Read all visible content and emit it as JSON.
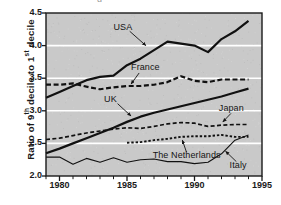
{
  "figure": {
    "partial_top_text": "g",
    "background_color": "#c9c9c9",
    "gridline_color": "#ffffff",
    "frame_color": "#1a1a1a",
    "line_color": "#111111"
  },
  "axis": {
    "ylabel_prefix": "Ratio of 9",
    "ylabel_sup1": "th",
    "ylabel_mid": " decile to 1",
    "ylabel_sup2": "st",
    "ylabel_suffix": " decile",
    "yticks": [
      "2.0",
      "2.5",
      "3.0",
      "3.5",
      "4.0",
      "4.5"
    ],
    "xticks": [
      "1980",
      "1985",
      "1990",
      "1995"
    ]
  },
  "chart_data": {
    "type": "line",
    "title": "",
    "xlabel": "",
    "ylabel": "Ratio of 9th decile to 1st decile",
    "xlim": [
      1979,
      1995
    ],
    "ylim": [
      2.0,
      4.5
    ],
    "grid": true,
    "legend_position": "inline-annotations",
    "series": [
      {
        "name": "USA",
        "style": "solid-thick",
        "label_x": 1984.0,
        "label_y": 4.27,
        "x": [
          1979,
          1980,
          1981,
          1982,
          1983,
          1984,
          1985,
          1986,
          1987,
          1988,
          1989,
          1990,
          1991,
          1992,
          1993,
          1994
        ],
        "values": [
          3.2,
          3.29,
          3.38,
          3.47,
          3.52,
          3.54,
          3.7,
          3.8,
          3.93,
          4.06,
          4.03,
          4.0,
          3.9,
          4.1,
          4.22,
          4.38
        ]
      },
      {
        "name": "France",
        "style": "dashed-long",
        "label_x": 1985.3,
        "label_y": 3.66,
        "x": [
          1979,
          1980,
          1981,
          1982,
          1983,
          1984,
          1985,
          1986,
          1987,
          1988,
          1989,
          1990,
          1991,
          1992,
          1993,
          1994
        ],
        "values": [
          3.4,
          3.4,
          3.42,
          3.37,
          3.33,
          3.36,
          3.38,
          3.38,
          3.4,
          3.44,
          3.53,
          3.46,
          3.44,
          3.48,
          3.48,
          3.48
        ]
      },
      {
        "name": "UK",
        "style": "solid-thick",
        "label_x": 1983.3,
        "label_y": 3.16,
        "x": [
          1979,
          1980,
          1981,
          1982,
          1983,
          1984,
          1985,
          1986,
          1987,
          1988,
          1989,
          1990,
          1991,
          1992,
          1993,
          1994
        ],
        "values": [
          2.35,
          2.42,
          2.5,
          2.58,
          2.66,
          2.74,
          2.83,
          2.91,
          2.97,
          3.02,
          3.07,
          3.12,
          3.17,
          3.22,
          3.28,
          3.34
        ]
      },
      {
        "name": "Japan",
        "style": "dashed-medium",
        "label_x": 1991.8,
        "label_y": 3.02,
        "x": [
          1979,
          1980,
          1981,
          1982,
          1983,
          1984,
          1985,
          1986,
          1987,
          1988,
          1989,
          1990,
          1991,
          1992,
          1993,
          1994
        ],
        "values": [
          2.56,
          2.58,
          2.62,
          2.66,
          2.69,
          2.72,
          2.74,
          2.73,
          2.76,
          2.8,
          2.82,
          2.81,
          2.76,
          2.78,
          2.79,
          2.79
        ]
      },
      {
        "name": "The Netherlands",
        "style": "dotted-fine",
        "label_x": 1986.9,
        "label_y": 2.3,
        "x": [
          1985,
          1986,
          1987,
          1988,
          1989,
          1990,
          1991,
          1992,
          1993,
          1994
        ],
        "values": [
          2.51,
          2.52,
          2.55,
          2.57,
          2.6,
          2.61,
          2.61,
          2.63,
          2.6,
          2.6
        ]
      },
      {
        "name": "Italy",
        "style": "solid-thin",
        "label_x": 1992.6,
        "label_y": 2.16,
        "x": [
          1979,
          1980,
          1981,
          1982,
          1983,
          1984,
          1985,
          1986,
          1987,
          1988,
          1989,
          1990,
          1991,
          1992,
          1993,
          1994
        ],
        "values": [
          2.29,
          2.29,
          2.18,
          2.27,
          2.21,
          2.28,
          2.21,
          2.25,
          2.26,
          2.22,
          2.22,
          2.19,
          2.21,
          2.34,
          2.55,
          2.63
        ]
      }
    ],
    "annotations": [
      {
        "series": "USA",
        "from_x": 1985.2,
        "from_y": 4.22,
        "to_x": 1986.4,
        "to_y": 4.0
      },
      {
        "series": "France",
        "from_x": 1985.9,
        "from_y": 3.58,
        "to_x": 1985.3,
        "to_y": 3.41
      },
      {
        "series": "UK",
        "from_x": 1984.3,
        "from_y": 3.11,
        "to_x": 1985.3,
        "to_y": 2.92
      },
      {
        "series": "Japan",
        "from_x": 1992.7,
        "from_y": 2.96,
        "to_x": 1992.1,
        "to_y": 2.83
      },
      {
        "series": "The Netherlands",
        "from_x": 1989.4,
        "from_y": 2.37,
        "to_x": 1989.1,
        "to_y": 2.55
      },
      {
        "series": "Italy",
        "from_x": 1993.1,
        "from_y": 2.22,
        "to_x": 1992.3,
        "to_y": 2.38
      }
    ]
  }
}
